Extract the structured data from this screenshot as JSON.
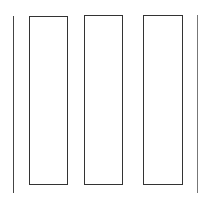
{
  "diagram": {
    "stroke_color": "#333333",
    "background": "#ffffff",
    "lines": [
      {
        "name": "left-line",
        "x": 13,
        "y": 16,
        "height": 177,
        "color": "#444444"
      },
      {
        "name": "right-line",
        "x": 197,
        "y": 15,
        "height": 178,
        "color": "#777777"
      }
    ],
    "boxes": [
      {
        "name": "box-1",
        "x": 29,
        "y": 16,
        "width": 39,
        "height": 169
      },
      {
        "name": "box-2",
        "x": 84,
        "y": 15,
        "width": 39,
        "height": 170
      },
      {
        "name": "box-3",
        "x": 143,
        "y": 15,
        "width": 40,
        "height": 170
      }
    ]
  }
}
